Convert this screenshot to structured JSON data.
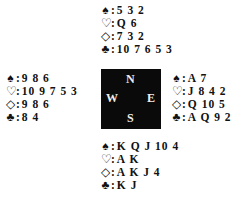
{
  "compass": {
    "north": "N",
    "south": "S",
    "west": "W",
    "east": "E"
  },
  "suits": {
    "spades": "♠",
    "hearts": "♡",
    "diamonds": "◇",
    "clubs": "♣"
  },
  "hands": {
    "north": {
      "spades": "5 3 2",
      "hearts": "Q 6",
      "diamonds": "7 3 2",
      "clubs": "10 7 6 5 3"
    },
    "west": {
      "spades": "9 8 6",
      "hearts": "10 9 7 5 3",
      "diamonds": "9 8 6",
      "clubs": "8 4"
    },
    "east": {
      "spades": "A 7",
      "hearts": "J 8 4 2",
      "diamonds": "Q 10 5",
      "clubs": "A Q 9 2"
    },
    "south": {
      "spades": "K Q J 10 4",
      "hearts": "A K",
      "diamonds": "A K J 4",
      "clubs": "K J"
    }
  }
}
